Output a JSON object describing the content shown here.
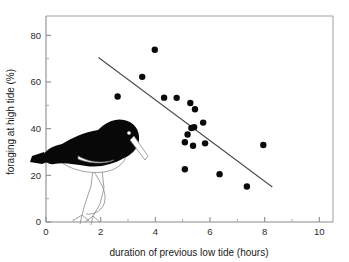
{
  "chart_data": {
    "type": "scatter",
    "title": "",
    "xlabel": "duration of previous low tide (hours)",
    "ylabel": "foraging at high tide (%)",
    "xlim": [
      0,
      10.5
    ],
    "ylim": [
      0,
      84
    ],
    "xticks": [
      0,
      2,
      4,
      6,
      8,
      10
    ],
    "yticks": [
      0,
      20,
      40,
      60,
      80
    ],
    "xticks_minor": [
      1,
      3,
      5,
      7,
      9
    ],
    "yticks_minor": [
      10,
      30,
      50,
      70
    ],
    "xtick_labels": [
      "0",
      "2",
      "4",
      "6",
      "8",
      "10"
    ],
    "ytick_labels": [
      "0",
      "20",
      "40",
      "60",
      "80"
    ],
    "grid": false,
    "legend": "none",
    "point_color": "#0a0a0a",
    "point_radius_px": 3.2,
    "line_color": "#4a4a4a",
    "axis_color": "#8c8c8c",
    "points": [
      {
        "x": 2.62,
        "y": 53.8
      },
      {
        "x": 3.52,
        "y": 62.2
      },
      {
        "x": 3.98,
        "y": 73.8
      },
      {
        "x": 4.32,
        "y": 53.3
      },
      {
        "x": 4.78,
        "y": 53.2
      },
      {
        "x": 5.28,
        "y": 51.0
      },
      {
        "x": 5.45,
        "y": 48.3
      },
      {
        "x": 5.08,
        "y": 34.2
      },
      {
        "x": 5.18,
        "y": 37.5
      },
      {
        "x": 5.32,
        "y": 40.3
      },
      {
        "x": 5.42,
        "y": 40.6
      },
      {
        "x": 5.75,
        "y": 42.6
      },
      {
        "x": 5.38,
        "y": 32.7
      },
      {
        "x": 5.82,
        "y": 33.7
      },
      {
        "x": 5.08,
        "y": 22.6
      },
      {
        "x": 6.35,
        "y": 20.5
      },
      {
        "x": 7.35,
        "y": 15.2
      },
      {
        "x": 7.95,
        "y": 33.0
      }
    ],
    "regression_line": {
      "x_start": 1.92,
      "y_start": 70.5,
      "x_end": 8.28,
      "y_end": 15.0,
      "description": "negative linear trend line"
    },
    "annotations": [
      {
        "name": "oystercatcher-illustration",
        "description": "silhouette drawing of an oystercatcher wading bird inside the plot area"
      }
    ]
  },
  "axes": {
    "x_title": "duration of previous low tide (hours)",
    "y_title": "foraging at high tide (%)",
    "x_labels": [
      "0",
      "2",
      "4",
      "6",
      "8",
      "10"
    ],
    "y_labels": [
      "0",
      "20",
      "40",
      "60",
      "80"
    ]
  }
}
